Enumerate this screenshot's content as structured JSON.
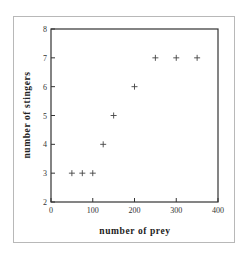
{
  "chart_data": {
    "type": "scatter",
    "title": "",
    "xlabel": "number of prey",
    "ylabel": "number of stingers",
    "xlim": [
      0,
      400
    ],
    "ylim": [
      2,
      8
    ],
    "x_ticks": [
      0,
      100,
      200,
      300,
      400
    ],
    "y_ticks": [
      2,
      3,
      4,
      5,
      6,
      7,
      8
    ],
    "grid": false,
    "legend": null,
    "marker": "+",
    "series": [
      {
        "name": "observations",
        "x": [
          50,
          75,
          100,
          125,
          150,
          200,
          250,
          300,
          350
        ],
        "y": [
          3,
          3,
          3,
          4,
          5,
          6,
          7,
          7,
          7
        ]
      }
    ]
  },
  "colors": {
    "axis": "#333333",
    "marker": "#444444",
    "frame": "#b8b8b8"
  }
}
